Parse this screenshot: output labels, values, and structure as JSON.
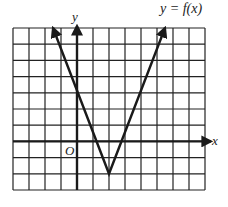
{
  "chart_data": {
    "type": "line",
    "title": "y = f(x)",
    "xlabel": "x",
    "ylabel": "y",
    "origin_label": "O",
    "xlim": [
      -4,
      8
    ],
    "ylim": [
      -3,
      7
    ],
    "grid": true,
    "series": [
      {
        "name": "f(x)",
        "x": [
          -1.5,
          2,
          5.5
        ],
        "y": [
          7,
          -2,
          7
        ],
        "note": "V-shaped absolute value graph, vertex at (2,-2), x-intercepts at 1 and 3, y-intercept 2, arrows at both ends"
      }
    ]
  },
  "colors": {
    "grid": "#222222",
    "line": "#1a1a1a",
    "background": "#ffffff"
  }
}
